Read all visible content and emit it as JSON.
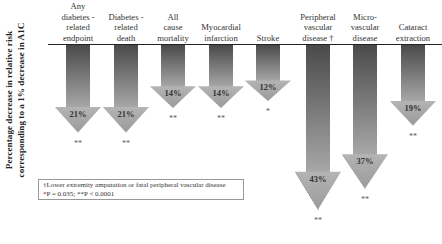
{
  "chart_data": {
    "type": "bar",
    "orientation": "downward-arrows",
    "title": "",
    "ylabel": "Percentage decrease in relative risk corresponding to a 1% decrease in A1C",
    "ylabel_lines": [
      "Percentage decrease in relative risk",
      "corresponding to a 1% decrease in A1C"
    ],
    "xlabel": "",
    "categories": [
      "Any diabetes - related endpoint",
      "Diabetes - related death",
      "All cause mortality",
      "Myocardial infarction",
      "Stroke",
      "Peripheral vascular disease †",
      "Micro-vascular disease",
      "Cataract extraction"
    ],
    "values": [
      21,
      21,
      14,
      14,
      12,
      43,
      37,
      19
    ],
    "value_labels": [
      "21%",
      "21%",
      "14%",
      "14%",
      "12%",
      "43%",
      "37%",
      "19%"
    ],
    "significance": [
      "**",
      "**",
      "**",
      "**",
      "*",
      "**",
      "**",
      "**"
    ],
    "grid": false,
    "legend": null,
    "footnotes": [
      "†Lower extremity amputation or fatal peripheral vascular disease",
      "*P = 0.035; **P < 0.0001"
    ]
  },
  "categories_display": [
    {
      "lines": [
        "Any",
        "diabetes -",
        "related",
        "endpoint"
      ]
    },
    {
      "lines": [
        "Diabetes -",
        "related",
        "death"
      ]
    },
    {
      "lines": [
        "All",
        "cause",
        "mortality"
      ]
    },
    {
      "lines": [
        "Myocardial",
        "infarction"
      ]
    },
    {
      "lines": [
        "Stroke"
      ]
    },
    {
      "lines": [
        "Peripheral",
        "vascular",
        "disease †"
      ]
    },
    {
      "lines": [
        "Micro-",
        "vascular",
        "disease"
      ]
    },
    {
      "lines": [
        "Cataract",
        "extraction"
      ]
    }
  ],
  "colors": {
    "arrow_dark": "#555555",
    "arrow_light": "#b8b8b8",
    "baseline": "#222222"
  }
}
